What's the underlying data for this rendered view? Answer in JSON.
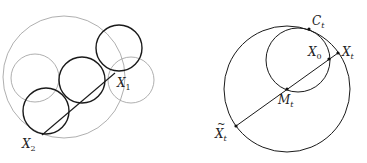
{
  "left_figure": {
    "colors": {
      "gray": "#9a9a9a",
      "black": "#1a1a1a"
    },
    "gray_circles": [
      {
        "name": "big-gray-circle",
        "cx": 64,
        "cy": 77,
        "r": 61
      },
      {
        "name": "left-gray-circle",
        "cx": 35,
        "cy": 78,
        "r": 24
      },
      {
        "name": "right-gray-circle",
        "cx": 131,
        "cy": 80,
        "r": 23
      }
    ],
    "black_circles": [
      {
        "name": "black-circle-top",
        "cx": 119,
        "cy": 48,
        "r": 23
      },
      {
        "name": "black-circle-middle",
        "cx": 82,
        "cy": 80,
        "r": 23
      },
      {
        "name": "black-circle-bottom",
        "cx": 46,
        "cy": 111,
        "r": 23
      }
    ],
    "segment": {
      "x1": 42,
      "y1": 135,
      "x2": 115,
      "y2": 73
    },
    "labels": {
      "x1": {
        "base": "X",
        "sub": "1"
      },
      "x2": {
        "base": "X",
        "sub": "2"
      }
    }
  },
  "right_figure": {
    "big_circle": {
      "cx": 287,
      "cy": 89,
      "r": 63
    },
    "small_circle": {
      "cx": 298,
      "cy": 60,
      "r": 32
    },
    "segment": {
      "x1": 236,
      "y1": 126,
      "x2": 338,
      "y2": 53
    },
    "points": {
      "Ct": {
        "x": 309,
        "y": 29
      },
      "Xt": {
        "x": 338,
        "y": 53
      },
      "X0": {
        "x": 329,
        "y": 59
      },
      "Mt": {
        "x": 287,
        "y": 89
      },
      "Xt_tilde": {
        "x": 236,
        "y": 126
      }
    },
    "labels": {
      "Ct": {
        "base": "C",
        "sub": "t"
      },
      "Xt": {
        "base": "X",
        "sub": "t"
      },
      "X0": {
        "base": "X",
        "sub": "0"
      },
      "Mt": {
        "base": "M",
        "sub": "t"
      },
      "Xt_tilde": {
        "base": "X",
        "sub": "t",
        "accent": "~"
      }
    }
  }
}
